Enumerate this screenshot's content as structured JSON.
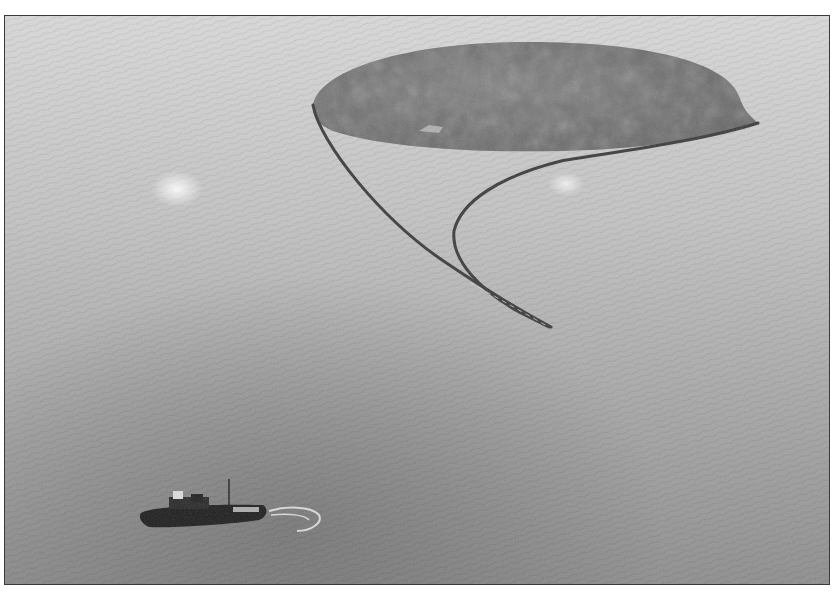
{
  "image": {
    "kind": "grayscale aerial photograph",
    "scene": "Tugboat on open water towing a long floating containment boom enclosing a large dark oil slick",
    "elements": [
      "sea-surface",
      "oil-slick",
      "containment-boom",
      "tugboat",
      "propeller-wake",
      "sun-glare"
    ],
    "colors": {
      "sea_light": "#d4d4d4",
      "sea_mid": "#a9a9a9",
      "sea_dark": "#7e7e7e",
      "slick": "#6a6a6a",
      "boom": "#3c3c3c",
      "boat": "#1e1e1e",
      "frame": "#3a3a3a"
    }
  }
}
